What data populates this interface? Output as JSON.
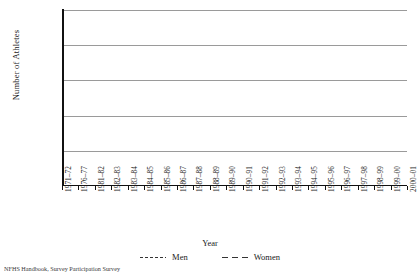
{
  "chart_data": {
    "type": "line",
    "title": "",
    "xlabel": "Year",
    "ylabel": "Number of Athletes",
    "ylim": [
      0,
      250000
    ],
    "yticks": [
      50000,
      100000,
      150000,
      200000,
      250000
    ],
    "ytick_labels": [
      "50,000",
      "100,000",
      "150,000",
      "200,000",
      "250,000"
    ],
    "grid": true,
    "legend_position": "bottom",
    "categories": [
      "1971–72",
      "1976–77",
      "1981–82",
      "1982–83",
      "1983–84",
      "1984–85",
      "1985–86",
      "1986–87",
      "1987–88",
      "1988–89",
      "1989–90",
      "1990–91",
      "1991–92",
      "1992–93",
      "1993–94",
      "1994–95",
      "1995–96",
      "1996–97",
      "1997–98",
      "1998–99",
      "1999–00",
      "2000–01"
    ],
    "series": [
      {
        "name": "Men",
        "linestyle": "dotted",
        "color": "#333333",
        "values": [
          172000,
          170000,
          152000,
          163000,
          178000,
          186000,
          196000,
          203000,
          199000,
          191000,
          183000,
          178000,
          177000,
          180000,
          181000,
          186000,
          209000,
          200000,
          201000,
          207000,
          208000,
          207000
        ]
      },
      {
        "name": "Women",
        "linestyle": "dashed",
        "color": "#333333",
        "values": [
          32000,
          62000,
          75000,
          81000,
          87000,
          93000,
          95000,
          91000,
          90000,
          92000,
          95000,
          96000,
          101000,
          106000,
          110000,
          117000,
          130000,
          131000,
          136000,
          146000,
          149000,
          150000
        ]
      }
    ]
  },
  "legend": {
    "men_label": "Men",
    "women_label": "Women"
  },
  "footnote": {
    "text": "NFHS Handbook, Survey Participation Survey"
  }
}
